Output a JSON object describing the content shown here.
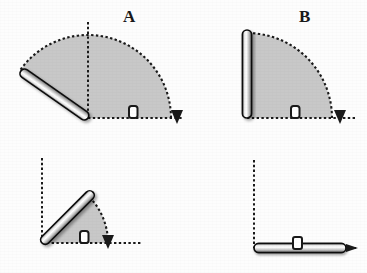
{
  "figure": {
    "title": "",
    "background_color": "#fdfdfd",
    "width": 367,
    "height": 273,
    "sector_fill_color": "#c8c8c8",
    "sector_edge_color": "#1a1a1a",
    "axis_color": "#1a1a1a",
    "rod_highlight_color": "#ffffff",
    "rod_shadow_color": "#8a8a8a",
    "rod_outline_color": "#111111",
    "label_color": "#1a1a1a"
  },
  "panels": [
    {
      "id": "A",
      "label": "A",
      "label_x": 123,
      "label_y": 10,
      "origin_x": 88,
      "origin_y": 118,
      "radius": 83,
      "vertical_axis_length": 96,
      "horizontal_axis_length": 95,
      "rod_angle_deg": 145,
      "rod_length": 82,
      "rod_thickness": 9,
      "sector_start_deg": 0,
      "sector_sweep_deg": 145,
      "sector_description": "shaded sector from horizontal axis counter-clockwise to rod",
      "angle_marker": "right-angle-square",
      "angle_marker_x": 133,
      "angle_marker_y": 112,
      "arrow_direction": "down",
      "arrow_x": 178,
      "arrow_y": 118
    },
    {
      "id": "B",
      "label": "B",
      "label_x": 299,
      "label_y": 10,
      "origin_x": 247,
      "origin_y": 118,
      "radius": 85,
      "vertical_axis_length": 96,
      "horizontal_axis_length": 110,
      "rod_angle_deg": 90,
      "rod_length": 88,
      "rod_thickness": 9,
      "sector_start_deg": 0,
      "sector_sweep_deg": 90,
      "sector_description": "shaded quarter sector from horizontal axis to vertical rod",
      "angle_marker": "right-angle-square",
      "angle_marker_x": 291,
      "angle_marker_y": 112,
      "arrow_direction": "down",
      "arrow_x": 340,
      "arrow_y": 118
    },
    {
      "id": "C",
      "label": "C",
      "label_x": 113,
      "label_y": 190,
      "origin_x": 42,
      "origin_y": 243,
      "radius": 66,
      "vertical_axis_length": 85,
      "horizontal_axis_length": 100,
      "rod_angle_deg": 45,
      "rod_length": 72,
      "rod_thickness": 9,
      "sector_start_deg": 0,
      "sector_sweep_deg": 45,
      "sector_description": "shaded sector from horizontal axis up to 45-degree rod",
      "angle_marker": "right-angle-square",
      "angle_marker_x": 84,
      "angle_marker_y": 237,
      "arrow_direction": "down",
      "arrow_x": 108,
      "arrow_y": 243
    },
    {
      "id": "D",
      "label": "D",
      "label_x": 294,
      "label_y": 189,
      "origin_x": 254,
      "origin_y": 248,
      "radius": 0,
      "vertical_axis_length": 88,
      "horizontal_axis_length": 98,
      "rod_angle_deg": 0,
      "rod_length": 92,
      "rod_thickness": 9,
      "sector_start_deg": 0,
      "sector_sweep_deg": 0,
      "sector_description": "no shaded sector; rod lies flat on the horizontal axis",
      "angle_marker": "right-angle-square",
      "angle_marker_x": 297,
      "angle_marker_y": 243,
      "arrow_direction": "right",
      "arrow_x": 352,
      "arrow_y": 248
    }
  ]
}
